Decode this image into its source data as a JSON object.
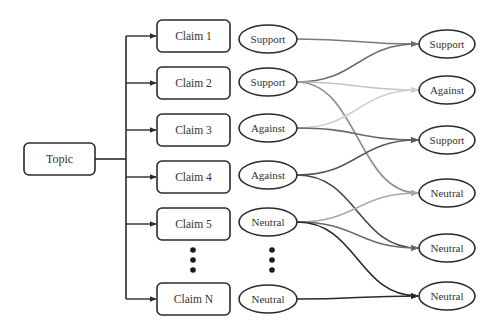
{
  "diagram": {
    "topic": {
      "label": "Topic",
      "x": 24,
      "y": 143,
      "w": 71,
      "h": 32
    },
    "trunk_x": 126,
    "claims": [
      {
        "label": "Claim 1",
        "cy": 36
      },
      {
        "label": "Claim 2",
        "cy": 83
      },
      {
        "label": "Claim 3",
        "cy": 130
      },
      {
        "label": "Claim 4",
        "cy": 177
      },
      {
        "label": "Claim 5",
        "cy": 224
      },
      {
        "label": "Claim N",
        "cy": 299
      }
    ],
    "claim_box": {
      "x": 157,
      "w": 73,
      "h": 32
    },
    "stances": [
      {
        "label": "Support",
        "cy": 39
      },
      {
        "label": "Support",
        "cy": 82
      },
      {
        "label": "Against",
        "cy": 128
      },
      {
        "label": "Against",
        "cy": 175
      },
      {
        "label": "Neutral",
        "cy": 222
      },
      {
        "label": "Neutral",
        "cy": 299
      }
    ],
    "stance_ellipse": {
      "cx": 268,
      "rx": 29,
      "ry": 14
    },
    "targets": [
      {
        "label": "Support",
        "cy": 44
      },
      {
        "label": "Against",
        "cy": 90
      },
      {
        "label": "Support",
        "cy": 140
      },
      {
        "label": "Neutral",
        "cy": 193
      },
      {
        "label": "Neutral",
        "cy": 248
      },
      {
        "label": "Neutral",
        "cy": 296
      }
    ],
    "target_ellipse": {
      "cx": 447,
      "rx": 28,
      "ry": 14
    },
    "ellipsis_dots": {
      "claims_x": 193,
      "stances_x": 272,
      "ys": [
        250,
        260,
        270
      ]
    },
    "edges": [
      {
        "from": 0,
        "to": 0,
        "color": "#7a7a7a"
      },
      {
        "from": 1,
        "to": 0,
        "color": "#6e6e6e"
      },
      {
        "from": 1,
        "to": 1,
        "color": "#c4c4c4"
      },
      {
        "from": 1,
        "to": 3,
        "color": "#8f8f8f"
      },
      {
        "from": 2,
        "to": 1,
        "color": "#cfcfcf"
      },
      {
        "from": 2,
        "to": 2,
        "color": "#6a6a6a"
      },
      {
        "from": 3,
        "to": 2,
        "color": "#5a5a5a"
      },
      {
        "from": 3,
        "to": 4,
        "color": "#4a4a4a"
      },
      {
        "from": 4,
        "to": 3,
        "color": "#a8a8a8"
      },
      {
        "from": 4,
        "to": 4,
        "color": "#6a6a6a"
      },
      {
        "from": 4,
        "to": 5,
        "color": "#2a2a2a"
      },
      {
        "from": 5,
        "to": 5,
        "color": "#2a2a2a"
      }
    ],
    "colors": {
      "stroke": "#2b2b2b",
      "text": "#333333",
      "background": "#ffffff"
    }
  }
}
